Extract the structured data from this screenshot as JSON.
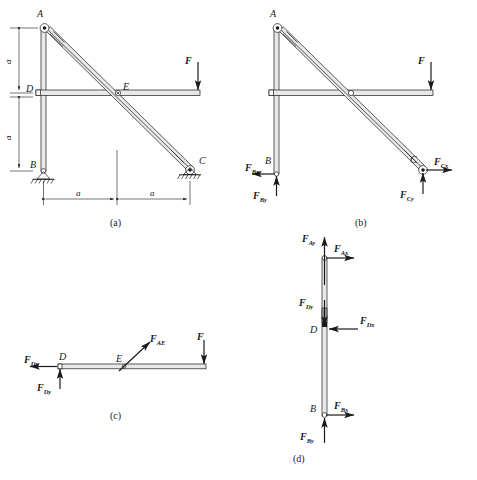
{
  "figure": {
    "captions": [
      {
        "id": "a",
        "text": "(a)"
      },
      {
        "id": "b",
        "text": "(b)"
      },
      {
        "id": "c",
        "text": "(c)"
      },
      {
        "id": "d",
        "text": "(d)"
      }
    ]
  },
  "panel_a": {
    "caption": "(a)",
    "joints": [
      {
        "name": "A",
        "label": "A"
      },
      {
        "name": "B",
        "label": "B"
      },
      {
        "name": "C",
        "label": "C"
      },
      {
        "name": "D",
        "label": "D"
      },
      {
        "name": "E",
        "label": "E"
      }
    ],
    "dimensions": [
      {
        "name": "vertical-upper",
        "label": "a"
      },
      {
        "name": "vertical-lower",
        "label": "a"
      },
      {
        "name": "horizontal-left",
        "label": "a"
      },
      {
        "name": "horizontal-right",
        "label": "a"
      }
    ],
    "loads": [
      {
        "name": "applied-force-F",
        "label": "F",
        "direction": "down"
      }
    ],
    "supports": [
      {
        "name": "pin-support-B",
        "type": "pin"
      },
      {
        "name": "pin-support-C",
        "type": "pin"
      }
    ]
  },
  "panel_b": {
    "caption": "(b)",
    "joints": [
      {
        "name": "A",
        "label": "A"
      },
      {
        "name": "B",
        "label": "B"
      },
      {
        "name": "C",
        "label": "C"
      }
    ],
    "forces": [
      {
        "name": "F",
        "symbol": "F",
        "sub": "",
        "direction": "down"
      },
      {
        "name": "FBx",
        "symbol": "F",
        "sub": "Bx",
        "direction": "left"
      },
      {
        "name": "FBy",
        "symbol": "F",
        "sub": "By",
        "direction": "up"
      },
      {
        "name": "FCx",
        "symbol": "F",
        "sub": "Cx",
        "direction": "right"
      },
      {
        "name": "FCy",
        "symbol": "F",
        "sub": "Cy",
        "direction": "up"
      }
    ]
  },
  "panel_c": {
    "caption": "(c)",
    "joints": [
      {
        "name": "D",
        "label": "D"
      },
      {
        "name": "E",
        "label": "E"
      }
    ],
    "forces": [
      {
        "name": "FDx",
        "symbol": "F",
        "sub": "Dx",
        "direction": "left"
      },
      {
        "name": "FDy",
        "symbol": "F",
        "sub": "Dy",
        "direction": "up"
      },
      {
        "name": "FAE",
        "symbol": "F",
        "sub": "AE",
        "direction": "up-right"
      },
      {
        "name": "F",
        "symbol": "F",
        "sub": "",
        "direction": "down"
      }
    ]
  },
  "panel_d": {
    "caption": "(d)",
    "joints": [
      {
        "name": "D",
        "label": "D"
      },
      {
        "name": "B",
        "label": "B"
      }
    ],
    "forces": [
      {
        "name": "FAy",
        "symbol": "F",
        "sub": "Ay",
        "direction": "up"
      },
      {
        "name": "FAx",
        "symbol": "F",
        "sub": "Ax",
        "direction": "right"
      },
      {
        "name": "FDy",
        "symbol": "F",
        "sub": "Dy",
        "direction": "down"
      },
      {
        "name": "FDx",
        "symbol": "F",
        "sub": "Dx",
        "direction": "left"
      },
      {
        "name": "FBx",
        "symbol": "F",
        "sub": "Bx",
        "direction": "right"
      },
      {
        "name": "FBy",
        "symbol": "F",
        "sub": "By",
        "direction": "up"
      }
    ]
  },
  "colors": {
    "ink": "#1a1a1a",
    "member_fill": "#e8e8e8",
    "background": "#ffffff"
  }
}
